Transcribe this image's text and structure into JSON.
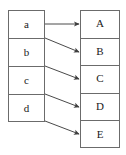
{
  "diagram": {
    "type": "mapping-diagram",
    "title": "",
    "canvas": {
      "width": 126,
      "height": 155,
      "background": "#ffffff"
    },
    "style": {
      "stroke": "#6b6b6b",
      "arrow_stroke": "#4a4a4a",
      "text_color": "#1a1a1a",
      "font_size_px": 11
    },
    "left_column": {
      "name": "domain-column",
      "x": 8,
      "y": 10,
      "width": 37,
      "height": 112,
      "cell_height": 28,
      "cells": [
        {
          "id": "a",
          "label": "a"
        },
        {
          "id": "b",
          "label": "b"
        },
        {
          "id": "c",
          "label": "c"
        },
        {
          "id": "d",
          "label": "d"
        }
      ]
    },
    "right_column": {
      "name": "codomain-column",
      "x": 80,
      "y": 10,
      "width": 40,
      "height": 138,
      "cell_height": 27.6,
      "cells": [
        {
          "id": "A",
          "label": "A"
        },
        {
          "id": "B",
          "label": "B"
        },
        {
          "id": "C",
          "label": "C"
        },
        {
          "id": "D",
          "label": "D"
        },
        {
          "id": "E",
          "label": "E"
        }
      ]
    },
    "arrows": [
      {
        "name": "arrow-a-to-A",
        "from": "a",
        "to": "A",
        "x1": 45,
        "y1": 24,
        "x2": 79,
        "y2": 24
      },
      {
        "name": "arrow-a-to-B",
        "from": "a",
        "to": "B",
        "x1": 45,
        "y1": 38,
        "x2": 79,
        "y2": 52
      },
      {
        "name": "arrow-b-to-C",
        "from": "b",
        "to": "C",
        "x1": 45,
        "y1": 66,
        "x2": 79,
        "y2": 79
      },
      {
        "name": "arrow-c-to-D",
        "from": "c",
        "to": "D",
        "x1": 45,
        "y1": 94,
        "x2": 79,
        "y2": 107
      },
      {
        "name": "arrow-d-to-E",
        "from": "d",
        "to": "E",
        "x1": 45,
        "y1": 121,
        "x2": 79,
        "y2": 134
      }
    ]
  }
}
